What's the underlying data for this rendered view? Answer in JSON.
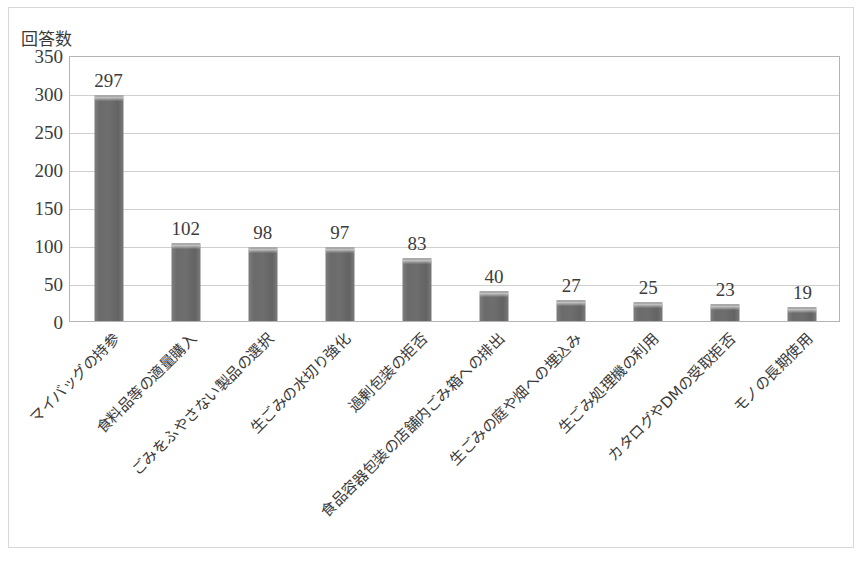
{
  "chart_data": {
    "type": "bar",
    "title": "",
    "ylabel": "回答数",
    "xlabel": "",
    "ylim": [
      0,
      350
    ],
    "ytick_step": 50,
    "yticks": [
      "350",
      "300",
      "250",
      "200",
      "150",
      "100",
      "50",
      "0"
    ],
    "grid": true,
    "legend": "none",
    "bar_color": "#6e6e6e",
    "categories": [
      "マイバッグの持参",
      "食料品等の適量購入",
      "ごみをふやさない製品の選択",
      "生ごみの水切り強化",
      "過剰包装の拒否",
      "食品容器包装の店舗内ごみ箱への排出",
      "生ごみの庭や畑への埋込み",
      "生ごみ処理機の利用",
      "カタログやDMの受取拒否",
      "モノの長期使用"
    ],
    "values": [
      297,
      102,
      98,
      97,
      83,
      40,
      27,
      25,
      23,
      19
    ],
    "value_labels": [
      "297",
      "102",
      "98",
      "97",
      "83",
      "40",
      "27",
      "25",
      "23",
      "19"
    ]
  }
}
